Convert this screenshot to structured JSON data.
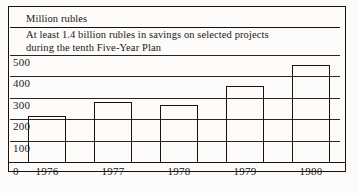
{
  "figure": {
    "unit_label": "Million rubles",
    "caption_line_1": "At least 1.4 billion rubles in savings on selected projects",
    "caption_line_2": "during the tenth Five-Year Plan",
    "zero_label": "0",
    "frame_color": "#15120f",
    "bar_outline_color": "#15120f",
    "background_color": "#fdfcfa"
  },
  "chart_data": {
    "type": "bar",
    "title": "At least 1.4 billion rubles in savings on selected projects during the tenth Five-Year Plan",
    "subtitle": "",
    "xlabel": "",
    "ylabel": "Million rubles",
    "categories": [
      "1976",
      "1977",
      "1978",
      "1979",
      "1980"
    ],
    "values": [
      215,
      280,
      265,
      355,
      455
    ],
    "ylim": [
      0,
      500
    ],
    "yticks": [
      100,
      200,
      300,
      400,
      500
    ],
    "ytick_labels": [
      "100",
      "200",
      "300",
      "400",
      "500"
    ],
    "grid": true,
    "legend": false,
    "bar_style": "outline"
  }
}
